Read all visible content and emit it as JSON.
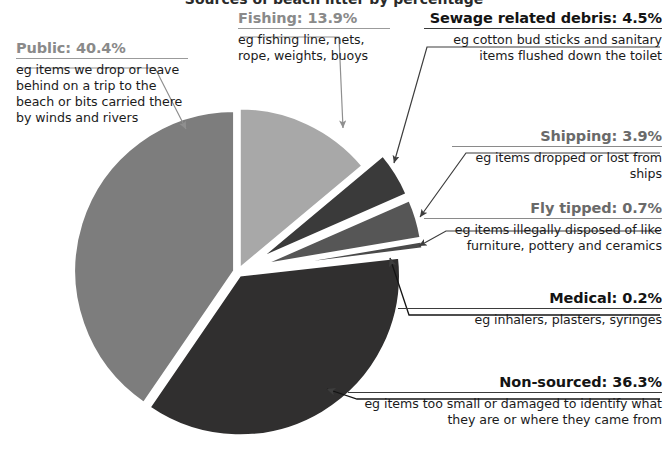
{
  "chart_data": {
    "type": "pie",
    "title": "Sources of beach litter by percentage",
    "categories": [
      "Public",
      "Fishing",
      "Sewage related debris",
      "Shipping",
      "Fly tipped",
      "Medical",
      "Non-sourced"
    ],
    "values": [
      40.4,
      13.9,
      4.5,
      3.9,
      0.7,
      0.2,
      36.3
    ],
    "units": "%",
    "legend": "none",
    "grid": false,
    "slice_colors": [
      "#7d7d7d",
      "#a8a8a8",
      "#3a3a3a",
      "#565656",
      "#4a4a4a",
      "#1c1c1c",
      "#302f2f"
    ],
    "exploded": [
      "Sewage related debris",
      "Shipping",
      "Fly tipped",
      "Medical"
    ],
    "annotations": [
      {
        "key": "public",
        "title": "Public: 40.4%",
        "value": 40.4,
        "description": "eg items we drop or leave behind on a trip to the beach or bits carried there by winds and rivers",
        "tone": "grey",
        "align": "left"
      },
      {
        "key": "fishing",
        "title": "Fishing: 13.9%",
        "value": 13.9,
        "description": "eg fishing line, nets, rope, weights, buoys",
        "tone": "grey",
        "align": "left"
      },
      {
        "key": "sewage",
        "title": "Sewage related debris: 4.5%",
        "value": 4.5,
        "description": "eg cotton bud sticks and sanitary items flushed down the toilet",
        "tone": "dark",
        "align": "right"
      },
      {
        "key": "shipping",
        "title": "Shipping: 3.9%",
        "value": 3.9,
        "description": "eg items dropped or lost from ships",
        "tone": "midgrey",
        "align": "right"
      },
      {
        "key": "flytipped",
        "title": "Fly tipped: 0.7%",
        "value": 0.7,
        "description": "eg items illegally disposed of like furniture, pottery and ceramics",
        "tone": "midgrey",
        "align": "right"
      },
      {
        "key": "medical",
        "title": "Medical: 0.2%",
        "value": 0.2,
        "description": "eg inhalers, plasters, syringes",
        "tone": "dark",
        "align": "right"
      },
      {
        "key": "nonsourced",
        "title": "Non-sourced: 36.3%",
        "value": 36.3,
        "description": "eg items too small or damaged to identify what they are or where they came from",
        "tone": "dark",
        "align": "right"
      }
    ]
  },
  "colors": {
    "background": "#ffffff",
    "leader_line": "#3d3d3d",
    "leader_line_light": "#8f8f8f",
    "text_dark": "#141414",
    "text_grey": "#8a8a8a"
  }
}
